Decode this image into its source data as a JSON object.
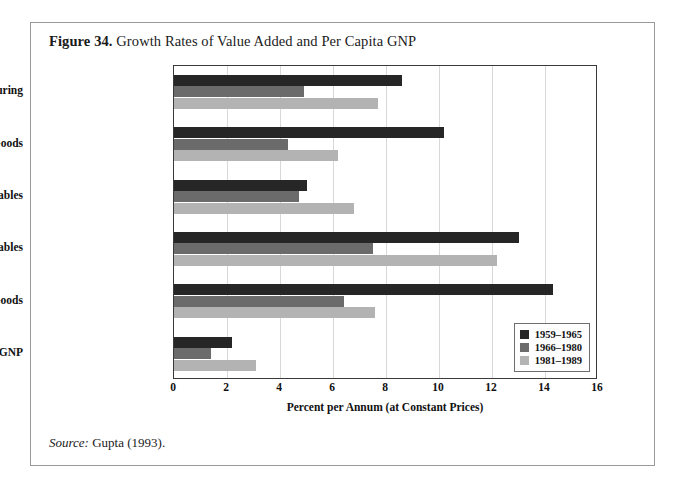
{
  "figure": {
    "number_label": "Figure 34.",
    "title": "Growth Rates of Value Added and Per Capita GNP",
    "source_label": "Source:",
    "source_text": " Gupta (1993)."
  },
  "legend": {
    "position": "bottom-right-inside-plot",
    "entries": [
      {
        "label": "1959–1965",
        "color": "#262626"
      },
      {
        "label": "1966–1980",
        "color": "#6b6b6b"
      },
      {
        "label": "1981–1989",
        "color": "#b3b3b3"
      }
    ]
  },
  "chart_data": {
    "type": "bar",
    "orientation": "horizontal",
    "title": "Growth Rates of Value Added and Per Capita GNP",
    "xlabel": "Percent per Annum (at Constant Prices)",
    "ylabel": "",
    "xlim": [
      0,
      16
    ],
    "xticks": [
      0,
      2,
      4,
      6,
      8,
      10,
      12,
      14,
      16
    ],
    "xticklabels": [
      "0",
      "2",
      "4",
      "6",
      "8",
      "10",
      "12",
      "14",
      "16"
    ],
    "grid": "vertical",
    "legend_position": "lower right",
    "categories": [
      "Factory Manufacturing",
      "Intermediate Goods",
      "Consumer Non-durables",
      "Consumer Durables",
      "Capital Goods",
      "Per Capita GNP"
    ],
    "series": [
      {
        "name": "1959–1965",
        "color": "#262626",
        "values": [
          8.6,
          10.2,
          5.0,
          13.0,
          14.3,
          2.2
        ]
      },
      {
        "name": "1966–1980",
        "color": "#6b6b6b",
        "values": [
          4.9,
          4.3,
          4.7,
          7.5,
          6.4,
          1.4
        ]
      },
      {
        "name": "1981–1989",
        "color": "#b3b3b3",
        "values": [
          7.7,
          6.2,
          6.8,
          12.2,
          7.6,
          3.1
        ]
      }
    ]
  }
}
